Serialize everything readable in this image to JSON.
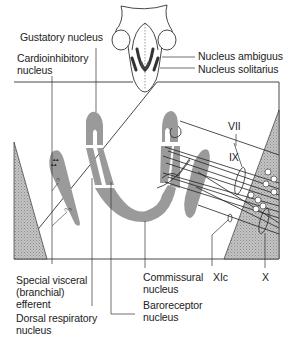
{
  "diagram": {
    "type": "anatomical-schematic",
    "labels": {
      "gustatory_nucleus": "Gustatory nucleus",
      "cardioinhibitory_nucleus": "Cardioinhibitory\nnucleus",
      "nucleus_ambiguus": "Nucleus ambiguus",
      "nucleus_solitarius": "Nucleus solitarius",
      "special_visceral_efferent": "Special visceral\n(branchial)\nefferent",
      "dorsal_respiratory_nucleus": "Dorsal respiratory\nnucleus",
      "commissural_nucleus": "Commissural\nnucleus",
      "baroreceptor_nucleus": "Baroreceptor\nnucleus",
      "nerve_vii": "VII",
      "nerve_ix": "IX",
      "nerve_xic": "XIc",
      "nerve_x": "X"
    },
    "colors": {
      "line": "#333333",
      "nucleus_fill": "#9a9a9a",
      "hatch_fill": "#b5b5b5",
      "ambiguus_dark": "#3a3a3a"
    }
  }
}
